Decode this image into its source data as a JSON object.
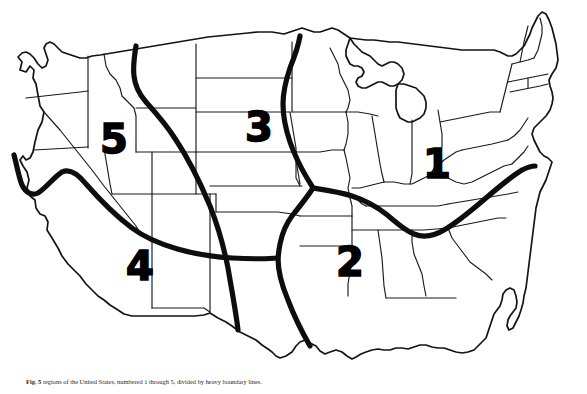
{
  "figure": {
    "type": "region-map",
    "subject": "United States",
    "caption_lead": "Fig. 5",
    "caption_text": "regions of the United States, numbered 1 through 5, divided by heavy boundary lines."
  },
  "map": {
    "background_color": "#ffffff",
    "outline_color": "#141414",
    "state_border_color": "#1a1a1a",
    "divider_color": "#0d0d0d",
    "label_color": "#000000"
  },
  "regions": [
    {
      "id": "region-1",
      "label": "1",
      "x": 437,
      "y": 164,
      "area": "East / Ohio Valley"
    },
    {
      "id": "region-2",
      "label": "2",
      "x": 350,
      "y": 262,
      "area": "South Central"
    },
    {
      "id": "region-3",
      "label": "3",
      "x": 259,
      "y": 127,
      "area": "Northern Plains"
    },
    {
      "id": "region-4",
      "label": "4",
      "x": 140,
      "y": 266,
      "area": "Southwest"
    },
    {
      "id": "region-5",
      "label": "5",
      "x": 114,
      "y": 139,
      "area": "Northwest"
    }
  ]
}
